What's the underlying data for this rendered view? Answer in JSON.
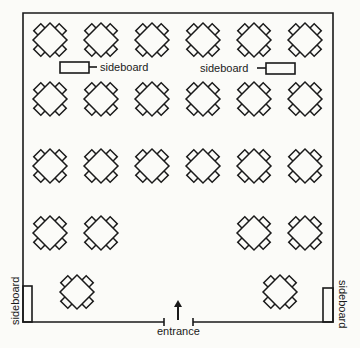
{
  "labels": {
    "sideboard_top_left": "sideboard",
    "sideboard_top_right": "sideboard",
    "sideboard_bottom_left": "sideboard",
    "sideboard_bottom_right": "sideboard",
    "entrance": "entrance"
  },
  "room": {
    "left": 23,
    "top": 13,
    "right": 333,
    "bottom": 322,
    "entrance_gap": [
      164,
      193
    ]
  },
  "tables": [
    {
      "row": 1,
      "x": 50,
      "y": 40
    },
    {
      "row": 1,
      "x": 101,
      "y": 40
    },
    {
      "row": 1,
      "x": 152,
      "y": 40
    },
    {
      "row": 1,
      "x": 203,
      "y": 40
    },
    {
      "row": 1,
      "x": 254,
      "y": 40
    },
    {
      "row": 1,
      "x": 305,
      "y": 40
    },
    {
      "row": 2,
      "x": 50,
      "y": 99
    },
    {
      "row": 2,
      "x": 101,
      "y": 99
    },
    {
      "row": 2,
      "x": 152,
      "y": 99
    },
    {
      "row": 2,
      "x": 203,
      "y": 99
    },
    {
      "row": 2,
      "x": 254,
      "y": 99
    },
    {
      "row": 2,
      "x": 305,
      "y": 99
    },
    {
      "row": 3,
      "x": 50,
      "y": 166
    },
    {
      "row": 3,
      "x": 101,
      "y": 166
    },
    {
      "row": 3,
      "x": 152,
      "y": 166
    },
    {
      "row": 3,
      "x": 203,
      "y": 166
    },
    {
      "row": 3,
      "x": 254,
      "y": 166
    },
    {
      "row": 3,
      "x": 305,
      "y": 166
    },
    {
      "row": 4,
      "x": 50,
      "y": 233
    },
    {
      "row": 4,
      "x": 101,
      "y": 233
    },
    {
      "row": 4,
      "x": 254,
      "y": 233
    },
    {
      "row": 4,
      "x": 305,
      "y": 233
    },
    {
      "row": 5,
      "x": 77,
      "y": 292
    },
    {
      "row": 5,
      "x": 280,
      "y": 292
    }
  ],
  "table_count": 24,
  "colors": {
    "ink": "#1a1a1a",
    "paper": "#fbfbf8"
  }
}
